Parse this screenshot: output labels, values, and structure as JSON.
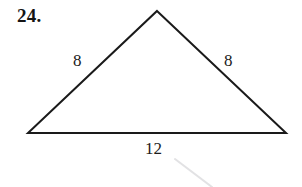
{
  "figure": {
    "problem_number": "24.",
    "shape": "triangle",
    "background_color": "#ffffff",
    "stroke_color": "#1a1a1a",
    "stroke_width": 2,
    "vertices": {
      "apex": {
        "x": 157,
        "y": 11
      },
      "bottom_left": {
        "x": 28,
        "y": 133
      },
      "bottom_right": {
        "x": 286,
        "y": 133
      }
    },
    "labels": {
      "left_side": "8",
      "right_side": "8",
      "base": "12"
    },
    "artifact": {
      "name": "scan-smudge-line",
      "color": "#e2e2e4",
      "x1": 175,
      "y1": 159,
      "x2": 212,
      "y2": 187
    }
  }
}
